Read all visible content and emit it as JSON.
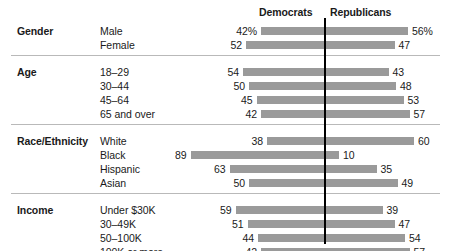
{
  "chart_data": {
    "type": "bar",
    "title": "",
    "subtitle": "",
    "xlabel": "",
    "ylabel": "",
    "orientation": "horizontal-diverging",
    "legend_position": "top",
    "grid": false,
    "axis_center_value": 0,
    "scale_px_per_unit": 1.5,
    "series": [
      {
        "name": "Democrats",
        "side": "left"
      },
      {
        "name": "Republicans",
        "side": "right"
      }
    ],
    "groups": [
      {
        "label": "Gender",
        "rows": [
          {
            "category": "Male",
            "democrats": 42,
            "republicans": 56,
            "democrats_text": "42%",
            "republicans_text": "56%"
          },
          {
            "category": "Female",
            "democrats": 52,
            "republicans": 47,
            "democrats_text": "52",
            "republicans_text": "47"
          }
        ]
      },
      {
        "label": "Age",
        "rows": [
          {
            "category": "18–29",
            "democrats": 54,
            "republicans": 43,
            "democrats_text": "54",
            "republicans_text": "43"
          },
          {
            "category": "30–44",
            "democrats": 50,
            "republicans": 48,
            "democrats_text": "50",
            "republicans_text": "48"
          },
          {
            "category": "45–64",
            "democrats": 45,
            "republicans": 53,
            "democrats_text": "45",
            "republicans_text": "53"
          },
          {
            "category": "65 and over",
            "democrats": 42,
            "republicans": 57,
            "democrats_text": "42",
            "republicans_text": "57"
          }
        ]
      },
      {
        "label": "Race/Ethnicity",
        "rows": [
          {
            "category": "White",
            "democrats": 38,
            "republicans": 60,
            "democrats_text": "38",
            "republicans_text": "60"
          },
          {
            "category": "Black",
            "democrats": 89,
            "republicans": 10,
            "democrats_text": "89",
            "republicans_text": "10"
          },
          {
            "category": "Hispanic",
            "democrats": 63,
            "republicans": 35,
            "democrats_text": "63",
            "republicans_text": "35"
          },
          {
            "category": "Asian",
            "democrats": 50,
            "republicans": 49,
            "democrats_text": "50",
            "republicans_text": "49"
          }
        ]
      },
      {
        "label": "Income",
        "rows": [
          {
            "category": "Under $30K",
            "democrats": 59,
            "republicans": 39,
            "democrats_text": "59",
            "republicans_text": "39"
          },
          {
            "category": "30–49K",
            "democrats": 51,
            "republicans": 47,
            "democrats_text": "51",
            "republicans_text": "47"
          },
          {
            "category": "50–100K",
            "democrats": 44,
            "republicans": 54,
            "democrats_text": "44",
            "republicans_text": "54"
          },
          {
            "category": "100K or more",
            "democrats": 42,
            "republicans": 57,
            "democrats_text": "42",
            "republicans_text": "57"
          }
        ]
      }
    ],
    "colors": {
      "bar": "#9a9a9a",
      "center_line": "#000000",
      "rule": "#b9b9b9",
      "text": "#1a1a1a",
      "background": "#ffffff"
    }
  },
  "header": {
    "democrats_label": "Democrats",
    "republicans_label": "Republicans"
  }
}
